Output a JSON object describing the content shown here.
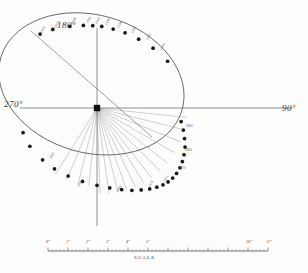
{
  "figure": {
    "name": "apparent-orbit-diagram",
    "title": "",
    "background": "#fdfdfc",
    "ink": "#2b2b2b"
  },
  "axes": {
    "north_label": "180°",
    "west_label": "270°",
    "east_label": "90°"
  },
  "scale_bar": {
    "caption": "SCALE",
    "unit": "″",
    "ticks": [
      {
        "label": "0″",
        "value": 0
      },
      {
        "label": "1″",
        "value": 1
      },
      {
        "label": "2″",
        "value": 2
      },
      {
        "label": "3″",
        "value": 3
      },
      {
        "label": "4″",
        "value": 4
      },
      {
        "label": "5″",
        "value": 5
      },
      {
        "label": "10″",
        "value": 10
      },
      {
        "label": "11″",
        "value": 11
      }
    ]
  },
  "chart_data": {
    "type": "scatter",
    "title": "",
    "xlabel": "",
    "ylabel": "",
    "grid": false,
    "legend": null,
    "primary_star": {
      "x": 0,
      "y": 0,
      "marker": "filled-square"
    },
    "ellipse": {
      "center_x": -0.33,
      "center_y": 1.42,
      "semi_major": 5.55,
      "semi_minor": 4.05,
      "tilt_deg": -16
    },
    "node_line": {
      "from_deg": 130,
      "to_deg": 310
    },
    "annotations_upper": [
      {
        "label": "1904",
        "x": -3.3,
        "y": 4.52
      },
      {
        "label": "1900",
        "x": -2.45,
        "y": 4.85
      },
      {
        "label": "1896",
        "x": -1.45,
        "y": 5.05
      },
      {
        "label": "1892",
        "x": -0.6,
        "y": 5.1
      },
      {
        "label": "1890",
        "x": -0.05,
        "y": 5.05
      },
      {
        "label": "1888",
        "x": 0.55,
        "y": 4.98
      },
      {
        "label": "1886",
        "x": 1.25,
        "y": 4.8
      },
      {
        "label": "1884",
        "x": 2.05,
        "y": 4.52
      },
      {
        "label": "1882",
        "x": 2.95,
        "y": 4.1
      },
      {
        "label": "1880",
        "x": 3.75,
        "y": 3.55
      }
    ],
    "annotations_right": [
      {
        "label": "1862",
        "x": 5.2,
        "y": -0.95
      },
      {
        "label": "1866",
        "x": 5.15,
        "y": -2.35
      },
      {
        "label": "1870",
        "x": 4.75,
        "y": -3.4
      }
    ],
    "annotations_lower": [
      {
        "label": "1876",
        "x": 3.05,
        "y": -4.55
      },
      {
        "label": "1874",
        "x": 3.95,
        "y": -4.25
      },
      {
        "label": "1882",
        "x": 1.15,
        "y": -4.8
      },
      {
        "label": "1888",
        "x": -1.1,
        "y": -4.55
      },
      {
        "label": "1900",
        "x": -2.75,
        "y": -2.9
      }
    ],
    "observation_points": [
      {
        "x": -3.35,
        "y": 4.35
      },
      {
        "x": -2.6,
        "y": 4.62
      },
      {
        "x": -1.6,
        "y": 4.8
      },
      {
        "x": -0.8,
        "y": 4.86
      },
      {
        "x": -0.25,
        "y": 4.84
      },
      {
        "x": 0.28,
        "y": 4.8
      },
      {
        "x": 0.95,
        "y": 4.64
      },
      {
        "x": 1.65,
        "y": 4.42
      },
      {
        "x": 2.45,
        "y": 4.05
      },
      {
        "x": 3.3,
        "y": 3.52
      },
      {
        "x": 4.15,
        "y": 2.75
      },
      {
        "x": 4.95,
        "y": -0.8
      },
      {
        "x": 5.08,
        "y": -1.3
      },
      {
        "x": 5.15,
        "y": -1.8
      },
      {
        "x": 5.18,
        "y": -2.3
      },
      {
        "x": 5.12,
        "y": -2.75
      },
      {
        "x": 5.02,
        "y": -3.15
      },
      {
        "x": 4.88,
        "y": -3.52
      },
      {
        "x": 4.68,
        "y": -3.85
      },
      {
        "x": 4.45,
        "y": -4.12
      },
      {
        "x": 4.18,
        "y": -4.35
      },
      {
        "x": 3.88,
        "y": -4.52
      },
      {
        "x": 3.52,
        "y": -4.66
      },
      {
        "x": 3.1,
        "y": -4.76
      },
      {
        "x": 2.6,
        "y": -4.82
      },
      {
        "x": 2.05,
        "y": -4.84
      },
      {
        "x": 1.45,
        "y": -4.8
      },
      {
        "x": 0.75,
        "y": -4.7
      },
      {
        "x": 0.0,
        "y": -4.55
      },
      {
        "x": -0.85,
        "y": -4.32
      },
      {
        "x": -1.7,
        "y": -4.0
      },
      {
        "x": -2.5,
        "y": -3.58
      },
      {
        "x": -3.2,
        "y": -3.05
      },
      {
        "x": -3.95,
        "y": -2.25
      },
      {
        "x": -4.35,
        "y": -1.45
      }
    ],
    "radial_lines_deg": [
      -6,
      -14,
      -22,
      -30,
      -38,
      -45,
      -52,
      -58,
      -64,
      -70,
      -76,
      -82,
      -88,
      -96,
      -104,
      -113,
      -122
    ]
  }
}
